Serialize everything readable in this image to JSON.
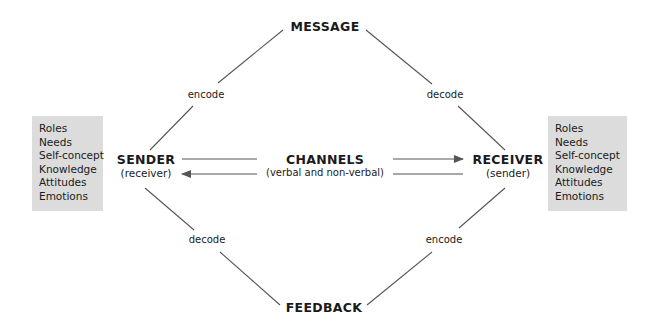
{
  "nodes": {
    "message": {
      "title": "MESSAGE"
    },
    "feedback": {
      "title": "FEEDBACK"
    },
    "sender": {
      "title": "SENDER",
      "subtitle": "(receiver)"
    },
    "receiver": {
      "title": "RECEIVER",
      "subtitle": "(sender)"
    },
    "channels": {
      "title": "CHANNELS",
      "subtitle": "(verbal and non-verbal)"
    }
  },
  "edge_labels": {
    "sender_to_message": "encode",
    "message_to_receiver": "decode",
    "sender_to_feedback": "decode",
    "receiver_to_feedback": "encode"
  },
  "sender_attributes": [
    "Roles",
    "Needs",
    "Self-concept",
    "Knowledge",
    "Attitudes",
    "Emotions"
  ],
  "receiver_attributes": [
    "Roles",
    "Needs",
    "Self-concept",
    "Knowledge",
    "Attitudes",
    "Emotions"
  ],
  "colors": {
    "box_fill": "#dcdcdc",
    "line": "#555555",
    "text": "#1a1a1a"
  }
}
